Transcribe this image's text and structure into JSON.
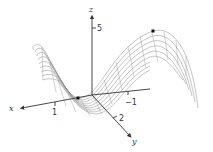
{
  "figure": {
    "type": "3d-surface-plot",
    "axes": {
      "x": {
        "label": "x",
        "ticks": [
          {
            "label": "1"
          },
          {
            "label": "−1"
          }
        ]
      },
      "y": {
        "label": "y",
        "ticks": [
          {
            "label": "2"
          }
        ]
      },
      "z": {
        "label": "z",
        "ticks": [
          {
            "label": "5"
          }
        ]
      }
    },
    "marked_points": [
      {
        "name": "saddle-low-point"
      },
      {
        "name": "peak-point"
      }
    ],
    "colors": {
      "mesh": "#8a8a8a",
      "axis": "#333333",
      "point": "#111111"
    }
  }
}
